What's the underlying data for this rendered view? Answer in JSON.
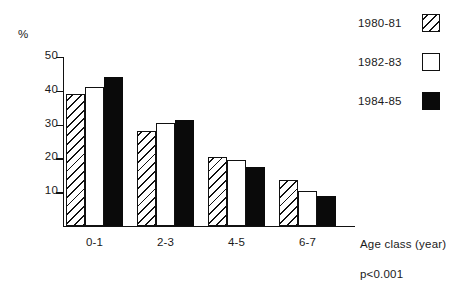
{
  "chart_data": {
    "type": "bar",
    "title": "",
    "xlabel": "Age class (year)",
    "ylabel": "%",
    "categories": [
      "0-1",
      "2-3",
      "4-5",
      "6-7"
    ],
    "series": [
      {
        "name": "1980-81",
        "style": "hatched",
        "values": [
          39,
          28,
          20.5,
          13.5
        ]
      },
      {
        "name": "1982-83",
        "style": "open",
        "values": [
          41,
          30.5,
          19.5,
          10.5
        ]
      },
      {
        "name": "1984-85",
        "style": "solid",
        "values": [
          44,
          31.5,
          17.5,
          9
        ]
      }
    ],
    "ylim": [
      0,
      50
    ],
    "yticks": [
      10,
      20,
      30,
      40,
      50
    ],
    "ytick_labels": [
      "10",
      "20",
      "30",
      "40",
      "50"
    ],
    "grid": false,
    "legend_position": "top-right",
    "annotations": [
      "p<0.001"
    ]
  },
  "axis": {
    "unit_label": "%",
    "x_title": "Age class (year)"
  },
  "legend": {
    "items": [
      {
        "label": "1980-81",
        "style": "hatch"
      },
      {
        "label": "1982-83",
        "style": "open"
      },
      {
        "label": "1984-85",
        "style": "solid"
      }
    ]
  },
  "stats": {
    "p_value": "p<0.001"
  },
  "colors": {
    "ink": "#111111",
    "fill_solid": "#0a0a0a",
    "fill_open": "#ffffff",
    "background": "#ffffff"
  }
}
